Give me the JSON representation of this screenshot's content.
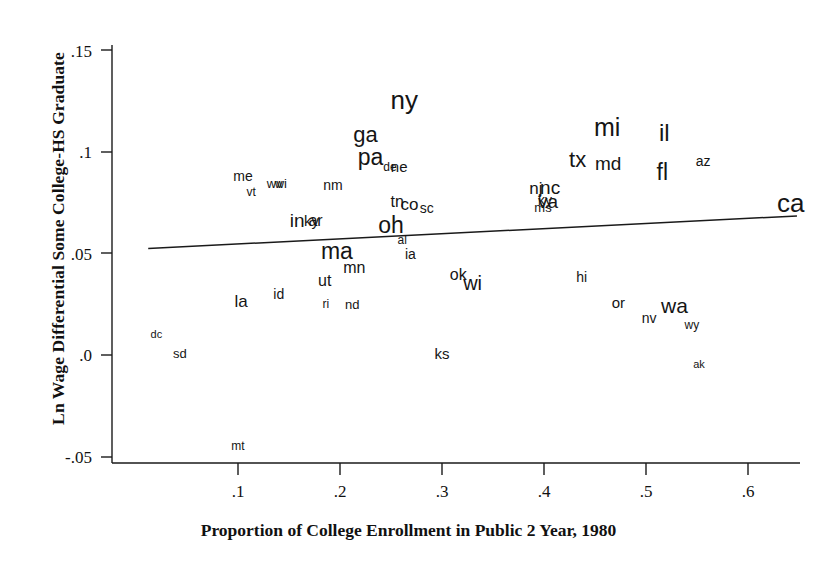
{
  "chart_data": {
    "type": "scatter",
    "title": "",
    "xlabel": "Proportion of College Enrollment in Public 2 Year, 1980",
    "ylabel": "Ln Wage Differential Some College-HS Graduate",
    "xlim": [
      0.0,
      0.655
    ],
    "ylim": [
      -0.055,
      0.158
    ],
    "xticks": [
      ".1",
      ".2",
      ".3",
      ".4",
      ".5",
      ".6"
    ],
    "xtick_values": [
      0.1,
      0.2,
      0.3,
      0.4,
      0.5,
      0.6
    ],
    "yticks": [
      ".15",
      ".1",
      ".05",
      ".0",
      "-.05"
    ],
    "ytick_values": [
      0.15,
      0.1,
      0.05,
      0.0,
      -0.05
    ],
    "grid": false,
    "legend": null,
    "point_marker": "text-label",
    "fit_line": {
      "label": "regression line",
      "x_start": 0.012,
      "y_start": 0.0525,
      "x_end": 0.648,
      "y_end": 0.0685
    },
    "points": [
      {
        "label": "ny",
        "x": 0.263,
        "y": 0.1255,
        "size": 26
      },
      {
        "label": "mi",
        "x": 0.462,
        "y": 0.1125,
        "size": 25
      },
      {
        "label": "il",
        "x": 0.518,
        "y": 0.1095,
        "size": 24
      },
      {
        "label": "ga",
        "x": 0.225,
        "y": 0.1085,
        "size": 22
      },
      {
        "label": "pa",
        "x": 0.23,
        "y": 0.0975,
        "size": 23
      },
      {
        "label": "de",
        "x": 0.249,
        "y": 0.0925,
        "size": 12
      },
      {
        "label": "ne",
        "x": 0.258,
        "y": 0.093,
        "size": 15
      },
      {
        "label": "az",
        "x": 0.556,
        "y": 0.0955,
        "size": 14
      },
      {
        "label": "tx",
        "x": 0.433,
        "y": 0.096,
        "size": 22
      },
      {
        "label": "md",
        "x": 0.463,
        "y": 0.0945,
        "size": 19
      },
      {
        "label": "fl",
        "x": 0.516,
        "y": 0.09,
        "size": 23
      },
      {
        "label": "me",
        "x": 0.105,
        "y": 0.088,
        "size": 14
      },
      {
        "label": "wv",
        "x": 0.136,
        "y": 0.0845,
        "size": 13
      },
      {
        "label": "wi",
        "x": 0.142,
        "y": 0.0845,
        "size": 13
      },
      {
        "label": "nm",
        "x": 0.193,
        "y": 0.0835,
        "size": 14
      },
      {
        "label": "vt",
        "x": 0.113,
        "y": 0.0805,
        "size": 12
      },
      {
        "label": "nj",
        "x": 0.392,
        "y": 0.0825,
        "size": 17
      },
      {
        "label": "nc",
        "x": 0.406,
        "y": 0.083,
        "size": 19
      },
      {
        "label": "va",
        "x": 0.404,
        "y": 0.076,
        "size": 19
      },
      {
        "label": "ky",
        "x": 0.401,
        "y": 0.0765,
        "size": 14
      },
      {
        "label": "ms",
        "x": 0.399,
        "y": 0.073,
        "size": 13
      },
      {
        "label": "tn",
        "x": 0.256,
        "y": 0.0755,
        "size": 16
      },
      {
        "label": "co",
        "x": 0.268,
        "y": 0.0745,
        "size": 17
      },
      {
        "label": "sc",
        "x": 0.285,
        "y": 0.0725,
        "size": 14
      },
      {
        "label": "ca",
        "x": 0.642,
        "y": 0.075,
        "size": 26
      },
      {
        "label": "in",
        "x": 0.158,
        "y": 0.0665,
        "size": 19
      },
      {
        "label": "ky",
        "x": 0.172,
        "y": 0.0665,
        "size": 15
      },
      {
        "label": "ar",
        "x": 0.176,
        "y": 0.066,
        "size": 16
      },
      {
        "label": "oh",
        "x": 0.25,
        "y": 0.064,
        "size": 23
      },
      {
        "label": "al",
        "x": 0.261,
        "y": 0.0565,
        "size": 12
      },
      {
        "label": "ma",
        "x": 0.197,
        "y": 0.051,
        "size": 23
      },
      {
        "label": "ia",
        "x": 0.269,
        "y": 0.05,
        "size": 14
      },
      {
        "label": "mn",
        "x": 0.214,
        "y": 0.043,
        "size": 16
      },
      {
        "label": "ok",
        "x": 0.316,
        "y": 0.0395,
        "size": 16
      },
      {
        "label": "wi",
        "x": 0.33,
        "y": 0.0355,
        "size": 20
      },
      {
        "label": "hi",
        "x": 0.437,
        "y": 0.0385,
        "size": 14
      },
      {
        "label": "ut",
        "x": 0.185,
        "y": 0.0365,
        "size": 16
      },
      {
        "label": "id",
        "x": 0.14,
        "y": 0.03,
        "size": 14
      },
      {
        "label": "la",
        "x": 0.103,
        "y": 0.0265,
        "size": 17
      },
      {
        "label": "ri",
        "x": 0.186,
        "y": 0.025,
        "size": 12
      },
      {
        "label": "nd",
        "x": 0.212,
        "y": 0.025,
        "size": 13
      },
      {
        "label": "or",
        "x": 0.473,
        "y": 0.026,
        "size": 15
      },
      {
        "label": "wa",
        "x": 0.528,
        "y": 0.0245,
        "size": 21
      },
      {
        "label": "nv",
        "x": 0.503,
        "y": 0.018,
        "size": 14
      },
      {
        "label": "wy",
        "x": 0.545,
        "y": 0.015,
        "size": 12
      },
      {
        "label": "dc",
        "x": 0.02,
        "y": 0.0105,
        "size": 11
      },
      {
        "label": "sd",
        "x": 0.043,
        "y": 0.001,
        "size": 13
      },
      {
        "label": "ks",
        "x": 0.3,
        "y": 0.001,
        "size": 15
      },
      {
        "label": "ak",
        "x": 0.552,
        "y": -0.0045,
        "size": 11
      },
      {
        "label": "mt",
        "x": 0.1,
        "y": -0.045,
        "size": 12
      }
    ]
  }
}
